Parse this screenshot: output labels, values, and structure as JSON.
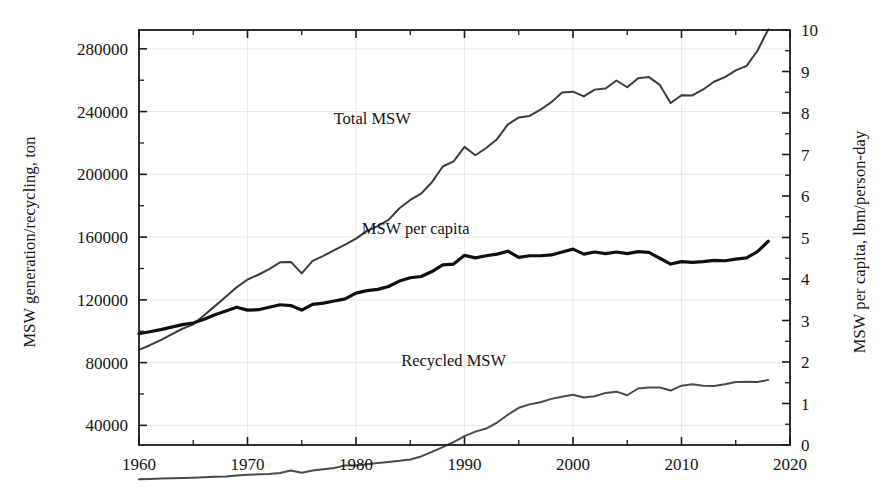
{
  "chart_data": {
    "type": "line",
    "title": "",
    "xlabel": "",
    "ylabel": "MSW generation/recycling, ton",
    "ylabel_right": "MSW per capita, lbm/person-day",
    "xlim": [
      1960,
      2020
    ],
    "ylim": [
      27500,
      292000
    ],
    "ylim_right": [
      0,
      10
    ],
    "grid": true,
    "legend_position": "inline-annotations",
    "xticks": [
      1960,
      1970,
      1980,
      1990,
      2000,
      2010,
      2020
    ],
    "xtick_labels": [
      "1960",
      "1970",
      "1980",
      "1990",
      "2000",
      "2010",
      "2020"
    ],
    "xminor_ticks": [
      1965,
      1975,
      1985,
      1995,
      2005,
      2015
    ],
    "yticks_left": [
      40000,
      80000,
      120000,
      160000,
      200000,
      240000,
      280000
    ],
    "ytick_labels_left": [
      "40000",
      "80000",
      "120000",
      "160000",
      "200000",
      "240000",
      "280000"
    ],
    "yminor_ticks_left": [
      60000,
      100000,
      140000,
      180000,
      220000,
      260000
    ],
    "yticks_right": [
      0,
      1,
      2,
      3,
      4,
      5,
      6,
      7,
      8,
      9,
      10
    ],
    "ytick_labels_right": [
      "0",
      "1",
      "2",
      "3",
      "4",
      "5",
      "6",
      "7",
      "8",
      "9",
      "10"
    ],
    "yminor_ticks_right": [
      0.5,
      1.5,
      2.5,
      3.5,
      4.5,
      5.5,
      6.5,
      7.5,
      8.5,
      9.5
    ],
    "annotations": [
      {
        "text": "Total MSW",
        "x": 1981.5,
        "y_left": 232000
      },
      {
        "text": "MSW per capita",
        "x": 1985.5,
        "y_left": 162000
      },
      {
        "text": "Recycled MSW",
        "x": 1989.0,
        "y_left": 78000
      }
    ],
    "series": [
      {
        "name": "Total MSW",
        "axis": "left",
        "color": "#3b3b3b",
        "line_width": 2.0,
        "x": [
          1960,
          1961,
          1962,
          1963,
          1964,
          1965,
          1966,
          1967,
          1968,
          1969,
          1970,
          1971,
          1972,
          1973,
          1974,
          1975,
          1976,
          1977,
          1978,
          1979,
          1980,
          1981,
          1982,
          1983,
          1984,
          1985,
          1986,
          1987,
          1988,
          1989,
          1990,
          1991,
          1992,
          1993,
          1994,
          1995,
          1996,
          1997,
          1998,
          1999,
          2000,
          2001,
          2002,
          2003,
          2004,
          2005,
          2006,
          2007,
          2008,
          2009,
          2010,
          2011,
          2012,
          2013,
          2014,
          2015,
          2016,
          2017,
          2018
        ],
        "values": [
          88120,
          91100,
          94400,
          98000,
          101600,
          104400,
          110200,
          116000,
          122000,
          128000,
          133000,
          136000,
          139600,
          143900,
          144200,
          136900,
          144800,
          148000,
          151700,
          155200,
          159000,
          164000,
          167000,
          171000,
          178400,
          183700,
          187700,
          195000,
          205000,
          208300,
          217500,
          212200,
          216800,
          222400,
          231800,
          236300,
          237200,
          241200,
          246000,
          252100,
          252700,
          249700,
          254000,
          254700,
          259800,
          255500,
          261300,
          262000,
          257000,
          245500,
          250400,
          250300,
          254100,
          259000,
          262000,
          266300,
          269100,
          278800,
          292400
        ]
      },
      {
        "name": "MSW per capita",
        "axis": "right",
        "color": "#0f0f0f",
        "line_width": 3.2,
        "x": [
          1960,
          1961,
          1962,
          1963,
          1964,
          1965,
          1966,
          1967,
          1968,
          1969,
          1970,
          1971,
          1972,
          1973,
          1974,
          1975,
          1976,
          1977,
          1978,
          1979,
          1980,
          1981,
          1982,
          1983,
          1984,
          1985,
          1986,
          1987,
          1988,
          1989,
          1990,
          1991,
          1992,
          1993,
          1994,
          1995,
          1996,
          1997,
          1998,
          1999,
          2000,
          2001,
          2002,
          2003,
          2004,
          2005,
          2006,
          2007,
          2008,
          2009,
          2010,
          2011,
          2012,
          2013,
          2014,
          2015,
          2016,
          2017,
          2018
        ],
        "values": [
          2.68,
          2.73,
          2.78,
          2.84,
          2.9,
          2.94,
          3.03,
          3.14,
          3.23,
          3.32,
          3.25,
          3.26,
          3.32,
          3.38,
          3.36,
          3.25,
          3.39,
          3.42,
          3.47,
          3.52,
          3.66,
          3.72,
          3.75,
          3.82,
          3.95,
          4.03,
          4.06,
          4.18,
          4.34,
          4.36,
          4.57,
          4.51,
          4.56,
          4.6,
          4.67,
          4.52,
          4.56,
          4.56,
          4.58,
          4.65,
          4.72,
          4.6,
          4.65,
          4.61,
          4.65,
          4.61,
          4.66,
          4.64,
          4.5,
          4.36,
          4.42,
          4.4,
          4.42,
          4.45,
          4.44,
          4.48,
          4.51,
          4.66,
          4.91
        ]
      },
      {
        "name": "Recycled MSW",
        "axis": "left",
        "color": "#4a4a4a",
        "line_width": 2.0,
        "x": [
          1960,
          1961,
          1962,
          1963,
          1964,
          1965,
          1966,
          1967,
          1968,
          1969,
          1970,
          1971,
          1972,
          1973,
          1974,
          1975,
          1976,
          1977,
          1978,
          1979,
          1980,
          1981,
          1982,
          1983,
          1984,
          1985,
          1986,
          1987,
          1988,
          1989,
          1990,
          1991,
          1992,
          1993,
          1994,
          1995,
          1996,
          1997,
          1998,
          1999,
          2000,
          2001,
          2002,
          2003,
          2004,
          2005,
          2006,
          2007,
          2008,
          2009,
          2010,
          2011,
          2012,
          2013,
          2014,
          2015,
          2016,
          2017,
          2018
        ],
        "values": [
          5610,
          5900,
          6100,
          6300,
          6500,
          6700,
          6900,
          7200,
          7500,
          8000,
          8600,
          8800,
          9000,
          9600,
          11200,
          9800,
          11200,
          12000,
          12800,
          14500,
          14500,
          15300,
          16100,
          16700,
          17400,
          18300,
          20200,
          23100,
          26200,
          29400,
          33200,
          36000,
          38000,
          41800,
          46800,
          51200,
          53400,
          54800,
          56900,
          58300,
          59500,
          57800,
          58600,
          60700,
          61500,
          59200,
          63500,
          64100,
          64100,
          62200,
          65300,
          66200,
          65200,
          65100,
          66200,
          67600,
          67800,
          67600,
          69000
        ]
      }
    ]
  }
}
